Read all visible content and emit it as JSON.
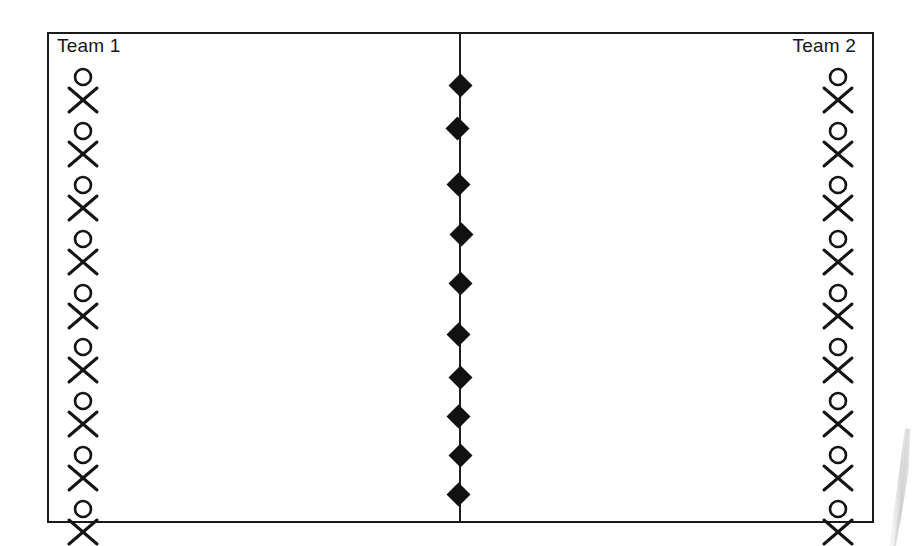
{
  "diagram": {
    "type": "team-matching-diagram",
    "background_color": "#ffffff",
    "frame": {
      "border_color": "#1a1a1a",
      "x": 47,
      "y": 32,
      "width": 827,
      "height": 491
    },
    "labels": {
      "left_team": "Team 1",
      "right_team": "Team 2"
    },
    "left_team": {
      "label": "Team 1",
      "member_icon": "person-icon",
      "member_count": 9,
      "members": [
        {
          "index": 1,
          "icon": "person-icon"
        },
        {
          "index": 2,
          "icon": "person-icon"
        },
        {
          "index": 3,
          "icon": "person-icon"
        },
        {
          "index": 4,
          "icon": "person-icon"
        },
        {
          "index": 5,
          "icon": "person-icon"
        },
        {
          "index": 6,
          "icon": "person-icon"
        },
        {
          "index": 7,
          "icon": "person-icon"
        },
        {
          "index": 8,
          "icon": "person-icon"
        },
        {
          "index": 9,
          "icon": "person-icon"
        }
      ]
    },
    "right_team": {
      "label": "Team 2",
      "member_icon": "person-icon",
      "member_count": 9,
      "members": [
        {
          "index": 1,
          "icon": "person-icon"
        },
        {
          "index": 2,
          "icon": "person-icon"
        },
        {
          "index": 3,
          "icon": "person-icon"
        },
        {
          "index": 4,
          "icon": "person-icon"
        },
        {
          "index": 5,
          "icon": "person-icon"
        },
        {
          "index": 6,
          "icon": "person-icon"
        },
        {
          "index": 7,
          "icon": "person-icon"
        },
        {
          "index": 8,
          "icon": "person-icon"
        },
        {
          "index": 9,
          "icon": "person-icon"
        }
      ]
    },
    "divider": {
      "icon": "vertical-line",
      "color": "#1f1f1f",
      "x": 459,
      "top": 33,
      "height": 489
    },
    "markers": {
      "icon": "diamond-marker",
      "color": "#111111",
      "count": 10,
      "size": 17,
      "points": [
        {
          "index": 1,
          "x": 452,
          "y": 77
        },
        {
          "index": 2,
          "x": 449,
          "y": 120
        },
        {
          "index": 3,
          "x": 450,
          "y": 176
        },
        {
          "index": 4,
          "x": 453,
          "y": 226
        },
        {
          "index": 5,
          "x": 452,
          "y": 275
        },
        {
          "index": 6,
          "x": 450,
          "y": 326
        },
        {
          "index": 7,
          "x": 452,
          "y": 369
        },
        {
          "index": 8,
          "x": 450,
          "y": 408
        },
        {
          "index": 9,
          "x": 452,
          "y": 447
        },
        {
          "index": 10,
          "x": 450,
          "y": 486
        }
      ]
    },
    "scan_artifact": {
      "icon": "scan-shadow",
      "color": "#b8b8b8",
      "description": "faint grey scanner shadow at bottom right"
    }
  }
}
